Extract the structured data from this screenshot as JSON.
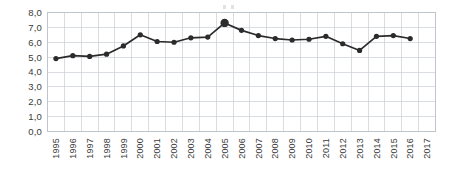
{
  "chart_data": {
    "type": "line",
    "title": "",
    "subtitle": "",
    "xlabel": "",
    "ylabel": "",
    "grid": true,
    "legend": "none",
    "decimal_separator": ",",
    "ylim": [
      0,
      8
    ],
    "ytick_labels": [
      "0,0",
      "1,0",
      "2,0",
      "3,0",
      "4,0",
      "5,0",
      "6,0",
      "7,0",
      "8,0"
    ],
    "ytick_values": [
      0,
      1,
      2,
      3,
      4,
      5,
      6,
      7,
      8
    ],
    "categories": [
      "1995",
      "1996",
      "1997",
      "1998",
      "1999",
      "2000",
      "2001",
      "2002",
      "2003",
      "2004",
      "2005",
      "2006",
      "2007",
      "2008",
      "2009",
      "2010",
      "2011",
      "2012",
      "2013",
      "2014",
      "2015",
      "2016",
      "2017"
    ],
    "x": [
      1995,
      1996,
      1997,
      1998,
      1999,
      2000,
      2001,
      2002,
      2003,
      2004,
      2005,
      2006,
      2007,
      2008,
      2009,
      2010,
      2011,
      2012,
      2013,
      2014,
      2015,
      2016,
      2017
    ],
    "values": [
      4.9,
      5.1,
      5.05,
      5.2,
      5.75,
      6.5,
      6.05,
      6.0,
      6.3,
      6.35,
      7.3,
      6.8,
      6.45,
      6.25,
      6.15,
      6.2,
      6.4,
      5.9,
      5.45,
      6.4,
      6.45,
      6.25,
      null
    ],
    "highlight_point": {
      "category": "2005",
      "value": 7.3
    },
    "series": [
      {
        "name": "",
        "values": [
          4.9,
          5.1,
          5.05,
          5.2,
          5.75,
          6.5,
          6.05,
          6.0,
          6.3,
          6.35,
          7.3,
          6.8,
          6.45,
          6.25,
          6.15,
          6.2,
          6.4,
          5.9,
          5.45,
          6.4,
          6.45,
          6.25,
          null
        ]
      }
    ],
    "annotations": [],
    "colors": {
      "line": "#2b2b2b",
      "marker": "#2b2b2b",
      "grid": "#c9cfd6",
      "border": "#b8bfc7",
      "text": "#3a3a3a",
      "background": "#ffffff"
    },
    "xtick_rotation": -90
  }
}
